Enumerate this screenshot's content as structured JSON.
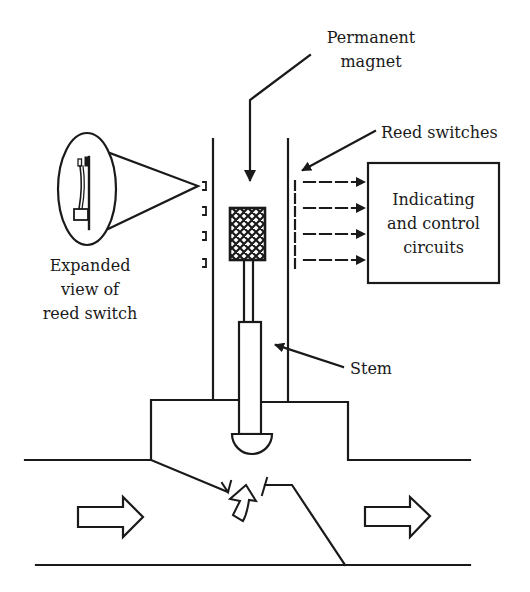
{
  "diagram": {
    "type": "reed switch valve position indicator",
    "colors": {
      "line": "#1a1a1a",
      "background": "#ffffff"
    },
    "labels": {
      "permanent_magnet": [
        "Permanent",
        "magnet"
      ],
      "reed_switches": "Reed switches",
      "indicating_box": [
        "Indicating",
        "and control",
        "circuits"
      ],
      "expanded_view": [
        "Expanded",
        "view of",
        "reed switch"
      ],
      "stem": "Stem"
    },
    "components": [
      {
        "id": "tube",
        "name": "Guide tube"
      },
      {
        "id": "magnet",
        "name": "Permanent magnet (crosshatched)"
      },
      {
        "id": "stem",
        "name": "Stem"
      },
      {
        "id": "plug",
        "name": "Valve plug"
      },
      {
        "id": "reed-switches",
        "count": 4
      },
      {
        "id": "signal-arrows",
        "count": 4
      },
      {
        "id": "control-box",
        "name": "Indicating and control circuits"
      },
      {
        "id": "flow-arrows",
        "direction": "left-to-right",
        "count": 2
      }
    ]
  }
}
